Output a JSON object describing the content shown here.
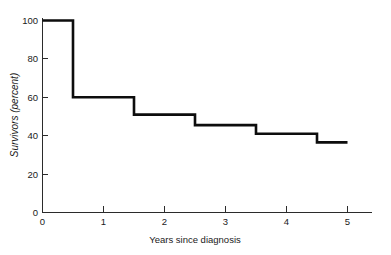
{
  "chart_data": {
    "type": "line",
    "subtype": "step-post",
    "title": "",
    "xlabel": "Years since diagnosis",
    "ylabel": "Survivors (percent)",
    "xlim": [
      0,
      5.45
    ],
    "ylim": [
      0,
      104
    ],
    "xticks": [
      0,
      1,
      2,
      3,
      4,
      5
    ],
    "xticklabels": [
      "0",
      "1",
      "2",
      "3",
      "4",
      "5"
    ],
    "yticks": [
      0,
      20,
      40,
      60,
      80,
      100
    ],
    "yticklabels": [
      "0",
      "20",
      "40",
      "60",
      "80",
      "100"
    ],
    "grid": false,
    "legend": false,
    "series": [
      {
        "name": "Survival curve",
        "color": "#0d0d0d",
        "x": [
          0,
          0.5,
          0.5,
          1.5,
          1.5,
          2.5,
          2.5,
          3.5,
          3.5,
          4.5,
          4.5,
          5.0
        ],
        "y": [
          100,
          100,
          60,
          60,
          51,
          51,
          45.5,
          45.5,
          41,
          41,
          36.5,
          36.5
        ],
        "step_times": [
          0,
          0.5,
          1.5,
          2.5,
          3.5,
          4.5
        ],
        "step_values": [
          100,
          60,
          51,
          45.5,
          41,
          36.5
        ]
      }
    ]
  },
  "axis": {
    "x_title": "Years since diagnosis",
    "y_title": "Survivors (percent)",
    "x_tick_labels": [
      "0",
      "1",
      "2",
      "3",
      "4",
      "5"
    ],
    "y_tick_labels": [
      "0",
      "20",
      "40",
      "60",
      "80",
      "100"
    ]
  },
  "colors": {
    "curve": "#0d0d0d",
    "axis": "#2b2b2b",
    "text": "#1a1a1a",
    "background": "#ffffff"
  }
}
